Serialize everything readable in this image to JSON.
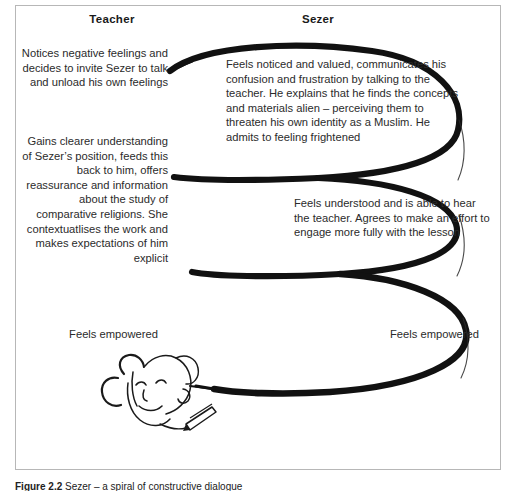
{
  "figure": {
    "columns": {
      "teacher_label": "Teacher",
      "sezer_label": "Sezer"
    },
    "teacher_steps": [
      "Notices negative feelings and decides to invite Sezer to talk and unload his own feelings",
      "Gains clearer understanding of Sezer’s position, feeds this back to him, offers reassurance and information about the study of comparative religions. She contextuatlises the work and makes expectations of him explicit",
      "Feels empowered"
    ],
    "sezer_steps": [
      "Feels noticed and valued, communicates his confusion and frustration by talking to the teacher. He explains that he finds the concepts and materials alien – perceiving them to threaten his own identity as a Muslim. He admits to feeling frightened",
      "Feels understood and is able to hear the teacher. Agrees to make an effort to engage more fully with the lesson",
      "Feels empowered"
    ],
    "caption_label": "Figure 2.2",
    "caption_text": "Sezer – a spiral of constructive dialogue",
    "icons": {
      "spiral": "spiral-arrow-icon",
      "face": "face-sketch-icon",
      "pen": "pen-icon"
    },
    "colors": {
      "ink": "#111111",
      "frame": "#b7b7b7",
      "text": "#2b2b2b"
    }
  }
}
